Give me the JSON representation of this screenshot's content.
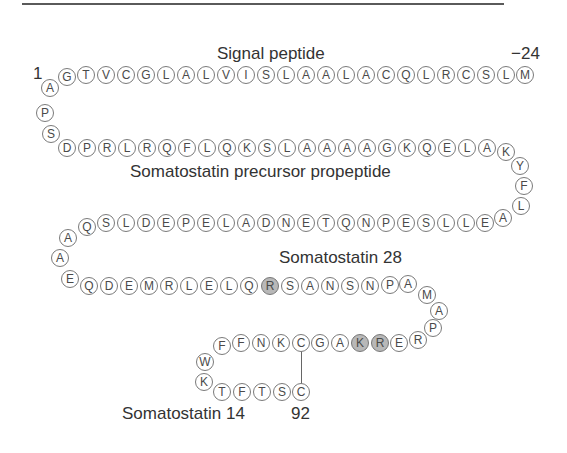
{
  "figure": {
    "labels": {
      "signal_peptide": "Signal peptide",
      "start_number": "1",
      "minus24": "−24",
      "propeptide": "Somatostatin precursor propeptide",
      "som28": "Somatostatin 28",
      "som14": "Somatostatin 14",
      "end_number": "92"
    },
    "colors": {
      "circle_border": "#7a7a7a",
      "shaded_fill": "#b8b8b8",
      "text": "#333333"
    },
    "disulfide_bond": {
      "from": "C (row 5, top)",
      "to": "C (92)"
    },
    "residues": [
      {
        "aa": "M",
        "x": 525,
        "y": 75
      },
      {
        "aa": "L",
        "x": 506,
        "y": 75
      },
      {
        "aa": "S",
        "x": 486,
        "y": 75
      },
      {
        "aa": "C",
        "x": 466,
        "y": 75
      },
      {
        "aa": "R",
        "x": 446,
        "y": 75
      },
      {
        "aa": "L",
        "x": 426,
        "y": 75
      },
      {
        "aa": "Q",
        "x": 406,
        "y": 75
      },
      {
        "aa": "C",
        "x": 386,
        "y": 75
      },
      {
        "aa": "A",
        "x": 366,
        "y": 75
      },
      {
        "aa": "L",
        "x": 346,
        "y": 75
      },
      {
        "aa": "A",
        "x": 326,
        "y": 75
      },
      {
        "aa": "A",
        "x": 306,
        "y": 75
      },
      {
        "aa": "L",
        "x": 286,
        "y": 75
      },
      {
        "aa": "S",
        "x": 266,
        "y": 75
      },
      {
        "aa": "I",
        "x": 246,
        "y": 75
      },
      {
        "aa": "V",
        "x": 226,
        "y": 75
      },
      {
        "aa": "L",
        "x": 206,
        "y": 75
      },
      {
        "aa": "A",
        "x": 186,
        "y": 75
      },
      {
        "aa": "L",
        "x": 166,
        "y": 75
      },
      {
        "aa": "G",
        "x": 146,
        "y": 75
      },
      {
        "aa": "C",
        "x": 126,
        "y": 75
      },
      {
        "aa": "V",
        "x": 106,
        "y": 75
      },
      {
        "aa": "T",
        "x": 86,
        "y": 75
      },
      {
        "aa": "G",
        "x": 67,
        "y": 77
      },
      {
        "aa": "A",
        "x": 50,
        "y": 88
      },
      {
        "aa": "P",
        "x": 45,
        "y": 113
      },
      {
        "aa": "S",
        "x": 51,
        "y": 134
      },
      {
        "aa": "D",
        "x": 67,
        "y": 148
      },
      {
        "aa": "P",
        "x": 87,
        "y": 148
      },
      {
        "aa": "R",
        "x": 107,
        "y": 148
      },
      {
        "aa": "L",
        "x": 127,
        "y": 148
      },
      {
        "aa": "R",
        "x": 147,
        "y": 148
      },
      {
        "aa": "Q",
        "x": 167,
        "y": 148
      },
      {
        "aa": "F",
        "x": 187,
        "y": 148
      },
      {
        "aa": "L",
        "x": 207,
        "y": 148
      },
      {
        "aa": "Q",
        "x": 227,
        "y": 148
      },
      {
        "aa": "K",
        "x": 247,
        "y": 148
      },
      {
        "aa": "S",
        "x": 267,
        "y": 148
      },
      {
        "aa": "L",
        "x": 287,
        "y": 148
      },
      {
        "aa": "A",
        "x": 307,
        "y": 148
      },
      {
        "aa": "A",
        "x": 327,
        "y": 148
      },
      {
        "aa": "A",
        "x": 347,
        "y": 148
      },
      {
        "aa": "A",
        "x": 367,
        "y": 148
      },
      {
        "aa": "G",
        "x": 387,
        "y": 148
      },
      {
        "aa": "K",
        "x": 407,
        "y": 148
      },
      {
        "aa": "Q",
        "x": 427,
        "y": 148
      },
      {
        "aa": "E",
        "x": 447,
        "y": 148
      },
      {
        "aa": "L",
        "x": 467,
        "y": 148
      },
      {
        "aa": "A",
        "x": 487,
        "y": 148
      },
      {
        "aa": "K",
        "x": 506,
        "y": 152
      },
      {
        "aa": "Y",
        "x": 520,
        "y": 166
      },
      {
        "aa": "F",
        "x": 524,
        "y": 186
      },
      {
        "aa": "L",
        "x": 521,
        "y": 206
      },
      {
        "aa": "A",
        "x": 503,
        "y": 218
      },
      {
        "aa": "E",
        "x": 485,
        "y": 223
      },
      {
        "aa": "L",
        "x": 466,
        "y": 223
      },
      {
        "aa": "L",
        "x": 446,
        "y": 223
      },
      {
        "aa": "S",
        "x": 426,
        "y": 223
      },
      {
        "aa": "E",
        "x": 406,
        "y": 223
      },
      {
        "aa": "P",
        "x": 386,
        "y": 223
      },
      {
        "aa": "N",
        "x": 366,
        "y": 223
      },
      {
        "aa": "Q",
        "x": 346,
        "y": 223
      },
      {
        "aa": "T",
        "x": 326,
        "y": 223
      },
      {
        "aa": "E",
        "x": 306,
        "y": 223
      },
      {
        "aa": "N",
        "x": 286,
        "y": 223
      },
      {
        "aa": "D",
        "x": 266,
        "y": 223
      },
      {
        "aa": "A",
        "x": 246,
        "y": 223
      },
      {
        "aa": "L",
        "x": 226,
        "y": 223
      },
      {
        "aa": "E",
        "x": 206,
        "y": 223
      },
      {
        "aa": "P",
        "x": 186,
        "y": 223
      },
      {
        "aa": "E",
        "x": 166,
        "y": 223
      },
      {
        "aa": "D",
        "x": 146,
        "y": 223
      },
      {
        "aa": "L",
        "x": 126,
        "y": 223
      },
      {
        "aa": "S",
        "x": 106,
        "y": 223
      },
      {
        "aa": "Q",
        "x": 87,
        "y": 227
      },
      {
        "aa": "A",
        "x": 68,
        "y": 238
      },
      {
        "aa": "A",
        "x": 60,
        "y": 258
      },
      {
        "aa": "E",
        "x": 70,
        "y": 279
      },
      {
        "aa": "Q",
        "x": 89,
        "y": 286
      },
      {
        "aa": "D",
        "x": 109,
        "y": 286
      },
      {
        "aa": "E",
        "x": 129,
        "y": 286
      },
      {
        "aa": "M",
        "x": 149,
        "y": 286
      },
      {
        "aa": "R",
        "x": 169,
        "y": 286
      },
      {
        "aa": "L",
        "x": 189,
        "y": 286
      },
      {
        "aa": "E",
        "x": 209,
        "y": 286
      },
      {
        "aa": "L",
        "x": 229,
        "y": 286
      },
      {
        "aa": "Q",
        "x": 249,
        "y": 286
      },
      {
        "aa": "R",
        "x": 270,
        "y": 286,
        "shaded": true
      },
      {
        "aa": "S",
        "x": 290,
        "y": 286
      },
      {
        "aa": "A",
        "x": 310,
        "y": 286
      },
      {
        "aa": "N",
        "x": 330,
        "y": 286
      },
      {
        "aa": "S",
        "x": 350,
        "y": 286
      },
      {
        "aa": "N",
        "x": 370,
        "y": 286
      },
      {
        "aa": "P",
        "x": 390,
        "y": 285
      },
      {
        "aa": "A",
        "x": 408,
        "y": 284
      },
      {
        "aa": "M",
        "x": 427,
        "y": 295
      },
      {
        "aa": "A",
        "x": 439,
        "y": 311
      },
      {
        "aa": "P",
        "x": 433,
        "y": 328
      },
      {
        "aa": "R",
        "x": 418,
        "y": 340
      },
      {
        "aa": "E",
        "x": 399,
        "y": 343
      },
      {
        "aa": "R",
        "x": 380,
        "y": 343,
        "shaded": true
      },
      {
        "aa": "K",
        "x": 360,
        "y": 343,
        "shaded": true
      },
      {
        "aa": "A",
        "x": 340,
        "y": 343
      },
      {
        "aa": "G",
        "x": 320,
        "y": 343
      },
      {
        "aa": "C",
        "x": 301,
        "y": 343
      },
      {
        "aa": "K",
        "x": 281,
        "y": 343
      },
      {
        "aa": "N",
        "x": 261,
        "y": 343
      },
      {
        "aa": "F",
        "x": 241,
        "y": 343
      },
      {
        "aa": "F",
        "x": 222,
        "y": 346
      },
      {
        "aa": "W",
        "x": 205,
        "y": 362
      },
      {
        "aa": "K",
        "x": 204,
        "y": 382
      },
      {
        "aa": "T",
        "x": 222,
        "y": 392
      },
      {
        "aa": "F",
        "x": 242,
        "y": 392
      },
      {
        "aa": "T",
        "x": 262,
        "y": 392
      },
      {
        "aa": "S",
        "x": 282,
        "y": 392
      },
      {
        "aa": "C",
        "x": 301,
        "y": 392
      }
    ]
  }
}
